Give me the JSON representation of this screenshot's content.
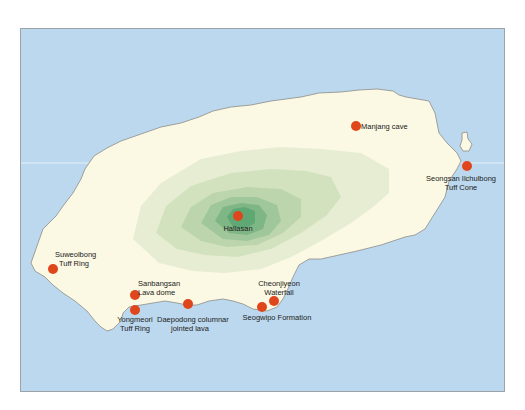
{
  "map": {
    "title": "Jeju Island geological sites",
    "colors": {
      "sea": "#bcd8ee",
      "land": "#fbf8e3",
      "elevation_low": "#dfe9cc",
      "elevation_mid": "#b7d3ac",
      "elevation_high": "#8fc095",
      "elevation_peak": "#5fa873",
      "marker": "#e0461c",
      "coastline": "#8d8d86"
    },
    "sites": [
      {
        "id": "manjang",
        "name": "Manjang cave",
        "lines": [
          "Manjang cave"
        ],
        "x": 355,
        "y": 125
      },
      {
        "id": "seongsan",
        "name": "Seongsan Ilchulbong Tuff Cone",
        "lines": [
          "Seongsan Ilchulbong",
          "Tuff Cone"
        ],
        "x": 466,
        "y": 165
      },
      {
        "id": "hallasan",
        "name": "Hallasan",
        "lines": [
          "Hallasan"
        ],
        "x": 237,
        "y": 215
      },
      {
        "id": "suweolbong",
        "name": "Suweolbong Tuff Ring",
        "lines": [
          "Suweolbong",
          "Tuff Ring"
        ],
        "x": 52,
        "y": 268
      },
      {
        "id": "sanbangsan",
        "name": "Sanbangsan Lava dome",
        "lines": [
          "Sanbangsan",
          "Lava dome"
        ],
        "x": 134,
        "y": 294
      },
      {
        "id": "yongmeori",
        "name": "Yongmeori Tuff Ring",
        "lines": [
          "Yongmeori",
          "Tuff Ring"
        ],
        "x": 134,
        "y": 309
      },
      {
        "id": "daepodong",
        "name": "Daepodong columnar jointed lava",
        "lines": [
          "Daepodong columnar",
          "jointed lava"
        ],
        "x": 187,
        "y": 303
      },
      {
        "id": "seogwipo",
        "name": "Seogwipo Formation",
        "lines": [
          "Seogwipo Formation"
        ],
        "x": 261,
        "y": 306
      },
      {
        "id": "cheonjiyeon",
        "name": "Cheonjiyeon Waterfall",
        "lines": [
          "Cheonjiyeon",
          "Waterfall"
        ],
        "x": 273,
        "y": 300
      }
    ]
  }
}
